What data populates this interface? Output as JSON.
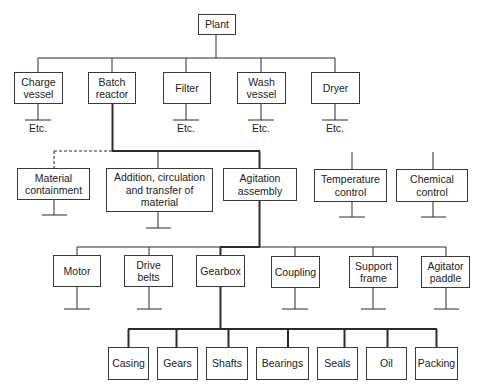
{
  "diagram": {
    "root": "Plant",
    "level1": [
      {
        "label": "Charge vessel",
        "lines": [
          "Charge",
          "vessel"
        ],
        "etc": "Etc."
      },
      {
        "label": "Batch reactor",
        "lines": [
          "Batch",
          "reactor"
        ]
      },
      {
        "label": "Filter",
        "lines": [
          "Filter"
        ],
        "etc": "Etc."
      },
      {
        "label": "Wash vessel",
        "lines": [
          "Wash",
          "vessel"
        ],
        "etc": "Etc."
      },
      {
        "label": "Dryer",
        "lines": [
          "Dryer"
        ],
        "etc": "Etc."
      }
    ],
    "level2": [
      {
        "label": "Material containment",
        "lines": [
          "Material",
          "containment"
        ],
        "connection": "dashed"
      },
      {
        "label": "Addition, circulation and transfer of material",
        "lines": [
          "Addition, circulation",
          "and transfer of",
          "material"
        ]
      },
      {
        "label": "Agitation assembly",
        "lines": [
          "Agitation",
          "assembly"
        ]
      },
      {
        "label": "Temperature control",
        "lines": [
          "Temperature",
          "control"
        ],
        "connection": "none"
      },
      {
        "label": "Chemical control",
        "lines": [
          "Chemical",
          "control"
        ],
        "connection": "none"
      }
    ],
    "level3": [
      {
        "label": "Motor",
        "lines": [
          "Motor"
        ]
      },
      {
        "label": "Drive belts",
        "lines": [
          "Drive",
          "belts"
        ]
      },
      {
        "label": "Gearbox",
        "lines": [
          "Gearbox"
        ]
      },
      {
        "label": "Coupling",
        "lines": [
          "Coupling"
        ]
      },
      {
        "label": "Support frame",
        "lines": [
          "Support",
          "frame"
        ]
      },
      {
        "label": "Agitator paddle",
        "lines": [
          "Agitator",
          "paddle"
        ]
      }
    ],
    "level4": [
      {
        "label": "Casing"
      },
      {
        "label": "Gears"
      },
      {
        "label": "Shafts"
      },
      {
        "label": "Bearings"
      },
      {
        "label": "Seals"
      },
      {
        "label": "Oil"
      },
      {
        "label": "Packing"
      }
    ],
    "colors": {
      "line": "#2b2b2b",
      "box_border": "#3a3a3a",
      "text": "#222222",
      "background": "#ffffff"
    }
  }
}
